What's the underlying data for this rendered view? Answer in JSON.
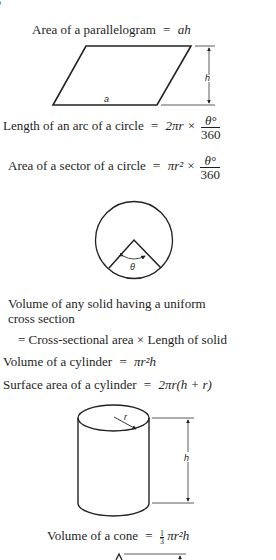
{
  "page_marker": "5",
  "formulas": {
    "parallelogram": {
      "label": "Area of a parallelogram",
      "eq": "=",
      "expr": "ah"
    },
    "arc": {
      "label": "Length of an arc of a circle",
      "eq": "=",
      "expr_prefix": "2πr ×",
      "frac_num": "θ°",
      "frac_den": "360"
    },
    "sector": {
      "label": "Area of a sector of a circle",
      "eq": "=",
      "expr_prefix": "πr² ×",
      "frac_num": "θ°",
      "frac_den": "360"
    },
    "uniform_solid": {
      "line1": "Volume of any solid having a uniform",
      "line2": "cross section",
      "line3": "= Cross-sectional area × Length of solid"
    },
    "cylinder_volume": {
      "label": "Volume of a cylinder",
      "eq": "=",
      "expr": "πr²h"
    },
    "cylinder_surface": {
      "label": "Surface area of a cylinder",
      "eq": "=",
      "expr": "2πr(h + r)"
    },
    "cone_volume": {
      "label": "Volume of a cone",
      "eq": "=",
      "frac_num": "1",
      "frac_den": "3",
      "expr": "πr²h"
    }
  },
  "diagrams": {
    "parallelogram": {
      "base_label": "a",
      "height_label": "h"
    },
    "sector": {
      "angle_label": "θ"
    },
    "cylinder": {
      "radius_label": "r",
      "height_label": "h"
    }
  }
}
